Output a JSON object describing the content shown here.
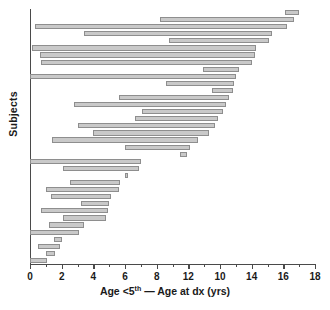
{
  "chart_data": {
    "type": "bar",
    "orientation": "horizontal",
    "subtype": "floating-range-bar",
    "title": "",
    "xlabel": "Age <5th — Age at dx (yrs)",
    "xlabel_parts": {
      "pre": "Age <5",
      "sup": "th",
      "post": " — Age at dx (yrs)"
    },
    "ylabel": "Subjects",
    "xlim": [
      0,
      18
    ],
    "ylim_note": "one bar per subject, unlabeled category axis",
    "grid": false,
    "legend": false,
    "bar_color": "#c9c9c9",
    "bar_edge_color": "#8e8e8e",
    "axis_color": "#4a4a4a",
    "xticks": [
      0,
      2,
      4,
      6,
      8,
      12,
      10,
      14,
      16,
      18
    ],
    "xtick_values": [
      0,
      2,
      4,
      6,
      8,
      10,
      12,
      14,
      16,
      18
    ],
    "xtick_labels": [
      "0",
      "2",
      "4",
      "6",
      "8",
      "12",
      "10",
      "14",
      "16",
      "18"
    ],
    "xtick_label_note": "labels at the 10 and 12 positions appear transposed in the source figure",
    "minor_ticks_every": 1,
    "n_bars": 36,
    "bars": [
      {
        "index": 1,
        "start": 16.1,
        "end": 17.0
      },
      {
        "index": 2,
        "start": 8.2,
        "end": 16.7
      },
      {
        "index": 3,
        "start": 0.3,
        "end": 16.2
      },
      {
        "index": 4,
        "start": 3.4,
        "end": 15.3
      },
      {
        "index": 5,
        "start": 8.8,
        "end": 15.1
      },
      {
        "index": 6,
        "start": 0.1,
        "end": 14.3
      },
      {
        "index": 7,
        "start": 0.6,
        "end": 14.2
      },
      {
        "index": 8,
        "start": 0.7,
        "end": 14.0
      },
      {
        "index": 9,
        "start": 10.9,
        "end": 13.2
      },
      {
        "index": 10,
        "start": 0.0,
        "end": 13.0
      },
      {
        "index": 11,
        "start": 8.6,
        "end": 12.9
      },
      {
        "index": 12,
        "start": 11.5,
        "end": 12.8
      },
      {
        "index": 13,
        "start": 5.6,
        "end": 12.6
      },
      {
        "index": 14,
        "start": 2.8,
        "end": 12.4
      },
      {
        "index": 15,
        "start": 7.1,
        "end": 12.2
      },
      {
        "index": 16,
        "start": 6.6,
        "end": 11.9
      },
      {
        "index": 17,
        "start": 3.0,
        "end": 11.7
      },
      {
        "index": 18,
        "start": 4.0,
        "end": 11.3
      },
      {
        "index": 19,
        "start": 1.4,
        "end": 10.6
      },
      {
        "index": 20,
        "start": 6.0,
        "end": 10.1
      },
      {
        "index": 21,
        "start": 9.5,
        "end": 9.9
      },
      {
        "index": 22,
        "start": 0.0,
        "end": 7.0
      },
      {
        "index": 23,
        "start": 2.1,
        "end": 6.9
      },
      {
        "index": 24,
        "start": 6.0,
        "end": 6.2
      },
      {
        "index": 25,
        "start": 2.5,
        "end": 5.7
      },
      {
        "index": 26,
        "start": 1.0,
        "end": 5.6
      },
      {
        "index": 27,
        "start": 1.3,
        "end": 5.1
      },
      {
        "index": 28,
        "start": 3.2,
        "end": 5.0
      },
      {
        "index": 29,
        "start": 0.7,
        "end": 4.9
      },
      {
        "index": 30,
        "start": 2.1,
        "end": 4.8
      },
      {
        "index": 31,
        "start": 1.2,
        "end": 3.4
      },
      {
        "index": 32,
        "start": 0.0,
        "end": 3.1
      },
      {
        "index": 33,
        "start": 1.5,
        "end": 2.0
      },
      {
        "index": 34,
        "start": 0.5,
        "end": 1.9
      },
      {
        "index": 35,
        "start": 1.0,
        "end": 1.6
      },
      {
        "index": 36,
        "start": 0.0,
        "end": 1.1
      }
    ]
  }
}
